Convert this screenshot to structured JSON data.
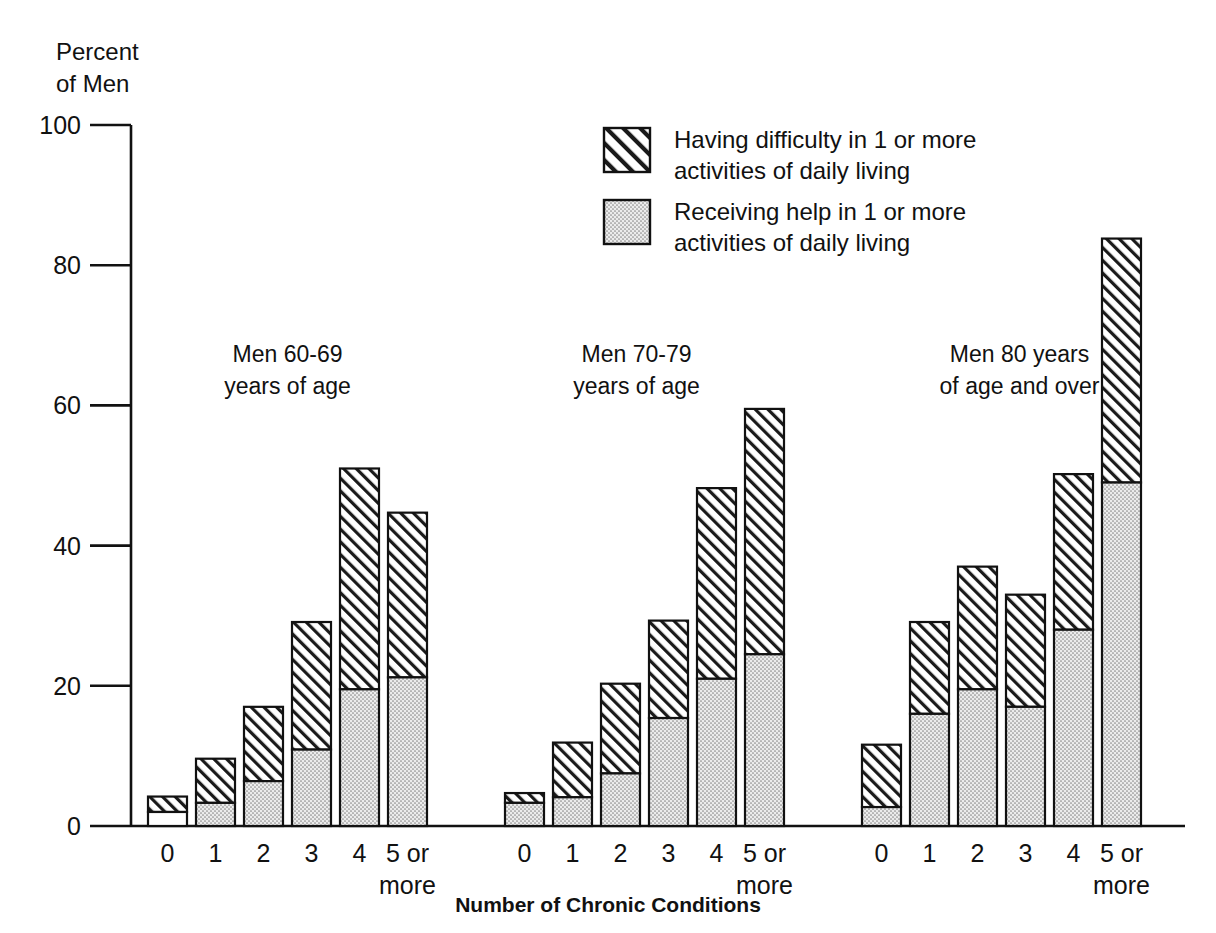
{
  "chart_data": {
    "type": "bar",
    "stacked": true,
    "title": "",
    "xlabel": "Number of Chronic Conditions",
    "ylabel": "Percent\nof Men",
    "ylabel_lines": [
      "Percent",
      "of Men"
    ],
    "ylim": [
      0,
      100
    ],
    "yticks": [
      0,
      20,
      40,
      60,
      80,
      100
    ],
    "ytick_labels": [
      "0",
      "20",
      "40",
      "60",
      "80",
      "100"
    ],
    "grid": false,
    "legend_position": "top-center",
    "categories": [
      "0",
      "1",
      "2",
      "3",
      "4",
      "5 or more"
    ],
    "category_label_lines": [
      [
        "0"
      ],
      [
        "1"
      ],
      [
        "2"
      ],
      [
        "3"
      ],
      [
        "4"
      ],
      [
        "5 or",
        "more"
      ]
    ],
    "series": [
      {
        "name": "Receiving help in 1 or more activities of daily living",
        "name_lines": [
          "Receiving help in 1 or more",
          "activities of daily living"
        ],
        "pattern": "dotted-stipple",
        "color": "#e3e3e3",
        "order": "bottom"
      },
      {
        "name": "Having difficulty in 1 or more activities of daily living",
        "name_lines": [
          "Having difficulty in 1 or more",
          "activities of daily living"
        ],
        "pattern": "diagonal-hatch",
        "color": "#ffffff",
        "order": "top"
      }
    ],
    "groups": [
      {
        "label": "Men 60-69 years of age",
        "label_lines": [
          "Men 60-69",
          "years of age"
        ],
        "receiving_help": [
          2.0,
          3.3,
          6.4,
          10.9,
          19.5,
          21.2
        ],
        "total_difficulty": [
          4.2,
          9.6,
          17.0,
          29.1,
          51.0,
          44.7
        ]
      },
      {
        "label": "Men 70-79 years of age",
        "label_lines": [
          "Men 70-79",
          "years of age"
        ],
        "receiving_help": [
          3.3,
          4.1,
          7.5,
          15.4,
          21.0,
          24.5
        ],
        "total_difficulty": [
          4.7,
          11.9,
          20.3,
          29.3,
          48.2,
          59.5
        ]
      },
      {
        "label": "Men 80 years of age and over",
        "label_lines": [
          "Men 80 years",
          "of age and over"
        ],
        "receiving_help": [
          2.7,
          16.0,
          19.5,
          17.0,
          28.0,
          49.0
        ],
        "total_difficulty": [
          11.6,
          29.1,
          37.0,
          33.0,
          50.2,
          83.8
        ]
      }
    ]
  },
  "legend": {
    "items": [
      {
        "swatch": "diagonal-hatch",
        "line1": "Having difficulty in 1 or more",
        "line2": "activities of daily living"
      },
      {
        "swatch": "dotted-stipple",
        "line1": "Receiving help in 1 or more",
        "line2": "activities of daily living"
      }
    ]
  },
  "axes": {
    "y_title_line1": "Percent",
    "y_title_line2": "of Men",
    "x_title": "Number of Chronic Conditions",
    "y_ticks": [
      "100",
      "80",
      "60",
      "40",
      "20",
      "0"
    ]
  }
}
